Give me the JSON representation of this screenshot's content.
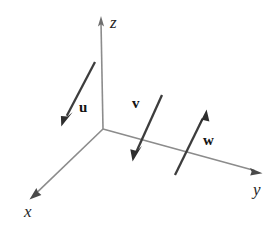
{
  "figure": {
    "kind": "3d-coordinate-axes-with-vectors",
    "width": 278,
    "height": 230,
    "background_color": "#ffffff"
  },
  "colors": {
    "axis": "#8c8c8c",
    "vector": "#3d3d3d",
    "axis_label_text": "#262626",
    "vector_label_text": "#141414"
  },
  "axes": [
    {
      "id": "z",
      "label": "z",
      "origin": {
        "x": 103,
        "y": 129
      },
      "tip": {
        "x": 101,
        "y": 17
      },
      "label_position": {
        "x": 110,
        "y": 14
      }
    },
    {
      "id": "x",
      "label": "x",
      "origin": {
        "x": 103,
        "y": 129
      },
      "tip": {
        "x": 30,
        "y": 198
      },
      "label_position": {
        "x": 24,
        "y": 203
      }
    },
    {
      "id": "y",
      "label": "y",
      "origin": {
        "x": 103,
        "y": 129
      },
      "tip": {
        "x": 262,
        "y": 173
      },
      "label_position": {
        "x": 253,
        "y": 181
      }
    }
  ],
  "vectors": [
    {
      "id": "u",
      "label": "u",
      "tail": {
        "x": 95,
        "y": 62
      },
      "tip": {
        "x": 62,
        "y": 125
      },
      "label_position": {
        "x": 79,
        "y": 100
      }
    },
    {
      "id": "v",
      "label": "v",
      "tail": {
        "x": 162,
        "y": 95
      },
      "tip": {
        "x": 133,
        "y": 160
      },
      "label_position": {
        "x": 132,
        "y": 96
      }
    },
    {
      "id": "w",
      "label": "w",
      "tail": {
        "x": 175,
        "y": 175
      },
      "tip": {
        "x": 206,
        "y": 110
      },
      "label_position": {
        "x": 203,
        "y": 133
      }
    }
  ]
}
